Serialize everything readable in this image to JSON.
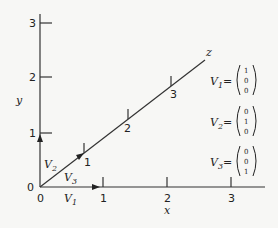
{
  "axes": {
    "x": {
      "label": "x",
      "ticks": [
        "1",
        "2",
        "3"
      ]
    },
    "y": {
      "label": "y",
      "ticks": [
        "1",
        "2",
        "3"
      ]
    },
    "z": {
      "label": "z",
      "ticks": [
        "1",
        "2",
        "3"
      ]
    },
    "origin_labels": [
      "0",
      "0"
    ]
  },
  "vectors": [
    {
      "name": "V",
      "sub": "1",
      "components": [
        "1",
        "0",
        "0"
      ]
    },
    {
      "name": "V",
      "sub": "2",
      "components": [
        "0",
        "1",
        "0"
      ]
    },
    {
      "name": "V",
      "sub": "3",
      "components": [
        "0",
        "0",
        "1"
      ]
    }
  ],
  "equals": "="
}
